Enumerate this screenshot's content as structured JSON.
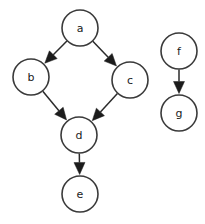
{
  "figure": {
    "background_color": "#ffffff",
    "width": 205,
    "height": 224
  },
  "style": {
    "node_fill": "#ffffff",
    "node_stroke": "#3a3a3a",
    "node_stroke_width": 1.6,
    "node_radius": 18,
    "label_color": "#1a1a1a",
    "label_font_size": 11,
    "edge_color": "#2b2b2b",
    "edge_width": 1.5,
    "arrowhead_color": "#1c1c1c",
    "arrowhead_length": 12,
    "arrowhead_width": 11
  },
  "graph": {
    "type": "directed",
    "node_count": 7,
    "edge_count": 6,
    "component_count": 2,
    "nodes": [
      {
        "id": "a",
        "label": "a",
        "cx": 80,
        "cy": 28,
        "r": 18
      },
      {
        "id": "b",
        "label": "b",
        "cx": 31,
        "cy": 77,
        "r": 18
      },
      {
        "id": "c",
        "label": "c",
        "cx": 130,
        "cy": 80,
        "r": 18
      },
      {
        "id": "d",
        "label": "d",
        "cx": 79,
        "cy": 135,
        "r": 18
      },
      {
        "id": "e",
        "label": "e",
        "cx": 80,
        "cy": 194,
        "r": 18
      },
      {
        "id": "f",
        "label": "f",
        "cx": 179,
        "cy": 51,
        "r": 18
      },
      {
        "id": "g",
        "label": "g",
        "cx": 179,
        "cy": 113,
        "r": 18
      }
    ],
    "edges": [
      {
        "id": "a-b",
        "from": "a",
        "to": "b",
        "directed": true
      },
      {
        "id": "a-c",
        "from": "a",
        "to": "c",
        "directed": true
      },
      {
        "id": "b-d",
        "from": "b",
        "to": "d",
        "directed": true
      },
      {
        "id": "c-d",
        "from": "c",
        "to": "d",
        "directed": true
      },
      {
        "id": "d-e",
        "from": "d",
        "to": "e",
        "directed": true
      },
      {
        "id": "f-g",
        "from": "f",
        "to": "g",
        "directed": true
      }
    ]
  }
}
